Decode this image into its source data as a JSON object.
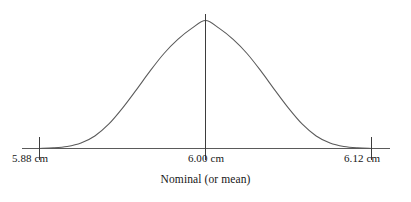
{
  "figure": {
    "title": "",
    "background_color": "#ffffff",
    "stroke_color": "#5a5a5a",
    "text_color": "#161616"
  },
  "axis": {
    "caption": "Nominal (or mean)",
    "line_color": "#5a5a5a",
    "tick_color": "#3d3d3d"
  },
  "labels": {
    "lower": "5.88 cm",
    "center": "6.00 cm",
    "upper": "6.12 cm"
  },
  "chart_data": {
    "type": "line",
    "title": "",
    "subtitle": "",
    "xlabel": "Nominal (or mean)",
    "ylabel": "",
    "curve": "normal-distribution-bell-curve",
    "mean": 6.0,
    "units": "cm",
    "lower_spec_limit": 5.88,
    "upper_spec_limit": 6.12,
    "tolerance": 0.12,
    "tick_labels": [
      "5.88 cm",
      "6.00 cm",
      "6.12 cm"
    ],
    "tick_values": [
      5.88,
      6.0,
      6.12
    ],
    "xlim": [
      5.88,
      6.12
    ],
    "ylim": [
      0,
      1
    ],
    "grid": false,
    "legend": null,
    "annotations": [
      "Nominal (or mean)"
    ],
    "x": [
      5.88,
      5.89,
      5.9,
      5.91,
      5.92,
      5.93,
      5.94,
      5.95,
      5.96,
      5.97,
      5.98,
      5.99,
      6.0,
      6.01,
      6.02,
      6.03,
      6.04,
      6.05,
      6.06,
      6.07,
      6.08,
      6.09,
      6.1,
      6.11,
      6.12
    ],
    "y": [
      0.0,
      0.004,
      0.015,
      0.042,
      0.097,
      0.189,
      0.315,
      0.458,
      0.606,
      0.742,
      0.852,
      0.938,
      1.0,
      0.938,
      0.852,
      0.742,
      0.606,
      0.458,
      0.315,
      0.189,
      0.097,
      0.042,
      0.015,
      0.004,
      0.0
    ],
    "series": [
      {
        "name": "Process distribution",
        "values": [
          0.0,
          0.004,
          0.015,
          0.042,
          0.097,
          0.189,
          0.315,
          0.458,
          0.606,
          0.742,
          0.852,
          0.938,
          1.0,
          0.938,
          0.852,
          0.742,
          0.606,
          0.458,
          0.315,
          0.189,
          0.097,
          0.042,
          0.015,
          0.004,
          0.0
        ]
      }
    ],
    "center_line": {
      "at": 6.0,
      "label": "6.00 cm",
      "style": "solid-vertical"
    }
  }
}
